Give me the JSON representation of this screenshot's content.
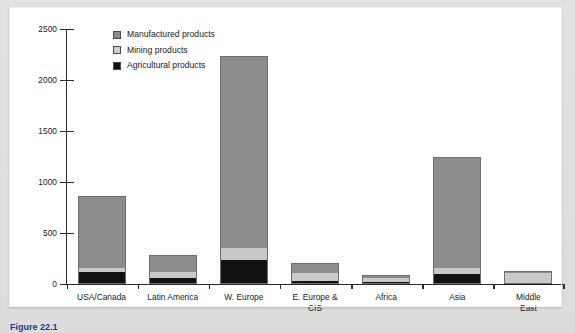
{
  "figure": {
    "caption": "Figure 22.1"
  },
  "chart_data": {
    "type": "bar",
    "stacked": true,
    "title": "",
    "subtitle": "",
    "xlabel": "",
    "ylabel": "$ billions",
    "ylim": [
      0,
      2500
    ],
    "yticks": [
      0,
      500,
      1000,
      1500,
      2000,
      2500
    ],
    "ytick_labels": [
      "0",
      "500",
      "1000",
      "1500",
      "2000",
      "2500"
    ],
    "grid": false,
    "legend_position": "top-left",
    "categories": [
      "USA/Canada",
      "Latin America",
      "W. Europe",
      "E. Europe &\nCIS",
      "Africa",
      "Asia",
      "Middle East"
    ],
    "series": [
      {
        "name": "Agricultural products",
        "color": "#121212",
        "values": [
          115,
          60,
          235,
          30,
          20,
          95,
          5
        ]
      },
      {
        "name": "Mining products",
        "color": "#c9c9c9",
        "values": [
          45,
          55,
          115,
          75,
          40,
          65,
          105
        ]
      },
      {
        "name": "Manufactured products",
        "color": "#8c8c8c",
        "values": [
          705,
          165,
          1890,
          100,
          25,
          1085,
          20
        ]
      }
    ],
    "totals": [
      865,
      280,
      2240,
      205,
      85,
      1245,
      130
    ]
  },
  "legend": {
    "items": [
      {
        "label": "Manufactured products",
        "color": "#8c8c8c"
      },
      {
        "label": "Mining products",
        "color": "#cfcfcf"
      },
      {
        "label": "Agricultural products",
        "color": "#121212"
      }
    ]
  }
}
